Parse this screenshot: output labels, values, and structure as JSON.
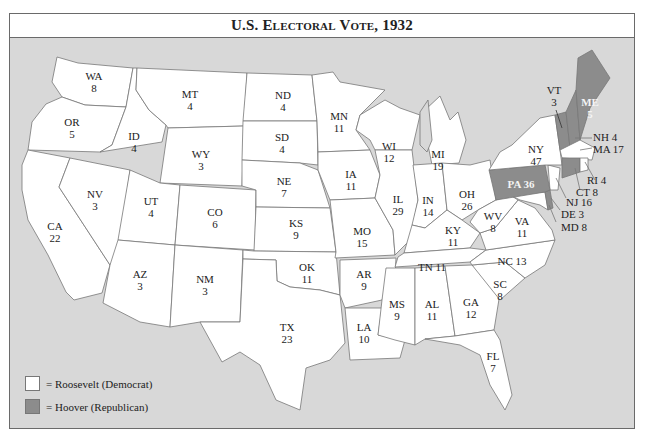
{
  "title": {
    "prefix": "U.S. E",
    "rest1": "lectoral",
    "mid": " V",
    "rest2": "ote",
    "year": ", 1932",
    "full": "U.S. Electoral Vote, 1932"
  },
  "colors": {
    "roosevelt": "#ffffff",
    "hoover": "#8c8c8c",
    "ocean": "#d8d8d8",
    "border": "#6a6a6a"
  },
  "legend": [
    {
      "label": "= Roosevelt (Democrat)",
      "color": "#ffffff"
    },
    {
      "label": "= Hoover (Republican)",
      "color": "#8c8c8c"
    }
  ],
  "states": {
    "WA": {
      "abbr": "WA",
      "votes": "8",
      "winner": "Roosevelt"
    },
    "OR": {
      "abbr": "OR",
      "votes": "5",
      "winner": "Roosevelt"
    },
    "CA": {
      "abbr": "CA",
      "votes": "22",
      "winner": "Roosevelt"
    },
    "ID": {
      "abbr": "ID",
      "votes": "4",
      "winner": "Roosevelt"
    },
    "NV": {
      "abbr": "NV",
      "votes": "3",
      "winner": "Roosevelt"
    },
    "MT": {
      "abbr": "MT",
      "votes": "4",
      "winner": "Roosevelt"
    },
    "WY": {
      "abbr": "WY",
      "votes": "3",
      "winner": "Roosevelt"
    },
    "UT": {
      "abbr": "UT",
      "votes": "4",
      "winner": "Roosevelt"
    },
    "AZ": {
      "abbr": "AZ",
      "votes": "3",
      "winner": "Roosevelt"
    },
    "CO": {
      "abbr": "CO",
      "votes": "6",
      "winner": "Roosevelt"
    },
    "NM": {
      "abbr": "NM",
      "votes": "3",
      "winner": "Roosevelt"
    },
    "ND": {
      "abbr": "ND",
      "votes": "4",
      "winner": "Roosevelt"
    },
    "SD": {
      "abbr": "SD",
      "votes": "4",
      "winner": "Roosevelt"
    },
    "NE": {
      "abbr": "NE",
      "votes": "7",
      "winner": "Roosevelt"
    },
    "KS": {
      "abbr": "KS",
      "votes": "9",
      "winner": "Roosevelt"
    },
    "OK": {
      "abbr": "OK",
      "votes": "11",
      "winner": "Roosevelt"
    },
    "TX": {
      "abbr": "TX",
      "votes": "23",
      "winner": "Roosevelt"
    },
    "MN": {
      "abbr": "MN",
      "votes": "11",
      "winner": "Roosevelt"
    },
    "IA": {
      "abbr": "IA",
      "votes": "11",
      "winner": "Roosevelt"
    },
    "MO": {
      "abbr": "MO",
      "votes": "15",
      "winner": "Roosevelt"
    },
    "AR": {
      "abbr": "AR",
      "votes": "9",
      "winner": "Roosevelt"
    },
    "LA": {
      "abbr": "LA",
      "votes": "10",
      "winner": "Roosevelt"
    },
    "WI": {
      "abbr": "WI",
      "votes": "12",
      "winner": "Roosevelt"
    },
    "IL": {
      "abbr": "IL",
      "votes": "29",
      "winner": "Roosevelt"
    },
    "MI": {
      "abbr": "MI",
      "votes": "19",
      "winner": "Roosevelt"
    },
    "IN": {
      "abbr": "IN",
      "votes": "14",
      "winner": "Roosevelt"
    },
    "OH": {
      "abbr": "OH",
      "votes": "26",
      "winner": "Roosevelt"
    },
    "KY": {
      "abbr": "KY",
      "votes": "11",
      "winner": "Roosevelt"
    },
    "TN": {
      "abbr": "TN",
      "votes": "11",
      "winner": "Roosevelt"
    },
    "MS": {
      "abbr": "MS",
      "votes": "9",
      "winner": "Roosevelt"
    },
    "AL": {
      "abbr": "AL",
      "votes": "11",
      "winner": "Roosevelt"
    },
    "GA": {
      "abbr": "GA",
      "votes": "12",
      "winner": "Roosevelt"
    },
    "FL": {
      "abbr": "FL",
      "votes": "7",
      "winner": "Roosevelt"
    },
    "SC": {
      "abbr": "SC",
      "votes": "8",
      "winner": "Roosevelt"
    },
    "NC": {
      "abbr": "NC",
      "votes": "13",
      "winner": "Roosevelt"
    },
    "VA": {
      "abbr": "VA",
      "votes": "11",
      "winner": "Roosevelt"
    },
    "WV": {
      "abbr": "WV",
      "votes": "8",
      "winner": "Roosevelt"
    },
    "MD": {
      "abbr": "MD",
      "votes": "8",
      "winner": "Roosevelt"
    },
    "DE": {
      "abbr": "DE",
      "votes": "3",
      "winner": "Hoover"
    },
    "NJ": {
      "abbr": "NJ",
      "votes": "16",
      "winner": "Roosevelt"
    },
    "PA": {
      "abbr": "PA",
      "votes": "36",
      "winner": "Hoover"
    },
    "NY": {
      "abbr": "NY",
      "votes": "47",
      "winner": "Roosevelt"
    },
    "CT": {
      "abbr": "CT",
      "votes": "8",
      "winner": "Hoover"
    },
    "RI": {
      "abbr": "RI",
      "votes": "4",
      "winner": "Roosevelt"
    },
    "MA": {
      "abbr": "MA",
      "votes": "17",
      "winner": "Roosevelt"
    },
    "VT": {
      "abbr": "VT",
      "votes": "3",
      "winner": "Hoover"
    },
    "NH": {
      "abbr": "NH",
      "votes": "4",
      "winner": "Hoover"
    },
    "ME": {
      "abbr": "ME",
      "votes": "5",
      "winner": "Hoover"
    }
  },
  "labels": {
    "WA": "WA\n8",
    "OR": "OR\n5",
    "CA": "CA\n22",
    "ID": "ID\n4",
    "NV": "NV\n3",
    "MT": "MT\n4",
    "WY": "WY\n3",
    "UT": "UT\n4",
    "AZ": "AZ\n3",
    "CO": "CO\n6",
    "NM": "NM\n3",
    "ND": "ND\n4",
    "SD": "SD\n4",
    "NE": "NE\n7",
    "KS": "KS\n9",
    "OK": "OK\n11",
    "TX": "TX\n23",
    "MN": "MN\n11",
    "IA": "IA\n11",
    "MO": "MO\n15",
    "AR": "AR\n9",
    "LA": "LA\n10",
    "WI": "WI\n12",
    "IL": "IL\n29",
    "MI": "MI\n19",
    "IN": "IN\n14",
    "OH": "OH\n26",
    "KY": "KY\n11",
    "TN": "TN 11",
    "MS": "MS\n9",
    "AL": "AL\n11",
    "GA": "GA\n12",
    "FL": "FL\n7",
    "SC": "SC\n8",
    "NC": "NC 13",
    "VA": "VA\n11",
    "WV": "WV\n8",
    "MD": "MD 8",
    "DE": "DE 3",
    "NJ": "NJ 16",
    "PA": "PA 36",
    "NY": "NY\n47",
    "CT": "CT 8",
    "RI": "RI 4",
    "MA": "MA 17",
    "VT": "VT\n3",
    "NH": "NH 4",
    "ME": "ME\n5"
  }
}
